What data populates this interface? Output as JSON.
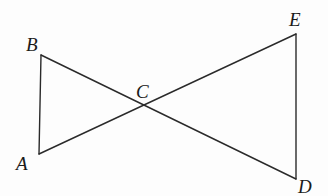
{
  "diagram": {
    "type": "geometry",
    "points": {
      "A": {
        "label": "A",
        "x": 39,
        "y": 154
      },
      "B": {
        "label": "B",
        "x": 41,
        "y": 55
      },
      "C": {
        "label": "C",
        "x": 144,
        "y": 105
      },
      "D": {
        "label": "D",
        "x": 296,
        "y": 179
      },
      "E": {
        "label": "E",
        "x": 296,
        "y": 34
      }
    },
    "segments": [
      {
        "from": "A",
        "to": "B"
      },
      {
        "from": "B",
        "to": "D"
      },
      {
        "from": "A",
        "to": "E"
      },
      {
        "from": "E",
        "to": "D"
      }
    ]
  }
}
